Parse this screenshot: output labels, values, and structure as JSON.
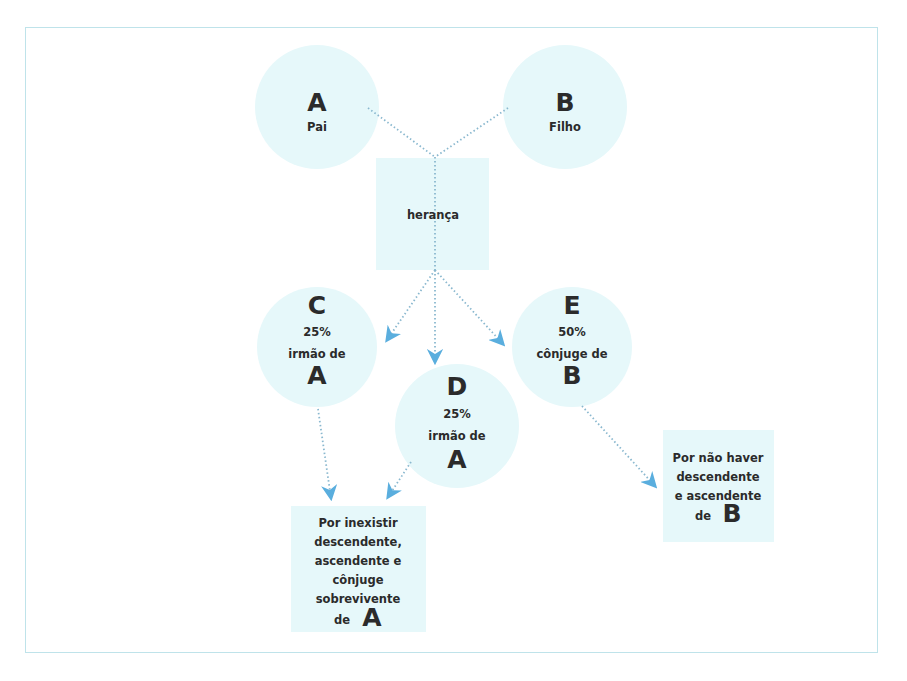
{
  "colors": {
    "fill": "#e6f8fa",
    "frame": "#bfe3ea",
    "connector": "#8ab8cf",
    "arrow": "#5aaede",
    "text": "#2b2b2b"
  },
  "nodes": {
    "A": {
      "shape": "circle",
      "letter": "A",
      "label": "Pai"
    },
    "B": {
      "shape": "circle",
      "letter": "B",
      "label": "Filho"
    },
    "heranca": {
      "shape": "square",
      "label": "herança"
    },
    "C": {
      "shape": "circle",
      "letter": "C",
      "percent": "25%",
      "relation": "irmão de",
      "ref": "A"
    },
    "D": {
      "shape": "circle",
      "letter": "D",
      "percent": "25%",
      "relation": "irmão de",
      "ref": "A"
    },
    "E": {
      "shape": "circle",
      "letter": "E",
      "percent": "50%",
      "relation": "cônjuge de",
      "ref": "B"
    },
    "note_A": {
      "shape": "box",
      "lines": [
        "Por inexistir",
        "descendente,",
        "ascendente e",
        "cônjuge",
        "sobrevivente"
      ],
      "last_prefix": "de",
      "ref": "A"
    },
    "note_B": {
      "shape": "box",
      "lines": [
        "Por não haver",
        "descendente",
        "e ascendente"
      ],
      "last_prefix": "de",
      "ref": "B"
    }
  },
  "edges": [
    {
      "from": "A",
      "to": "heranca",
      "style": "dotted",
      "arrow": false
    },
    {
      "from": "B",
      "to": "heranca",
      "style": "dotted",
      "arrow": false
    },
    {
      "from": "heranca",
      "to": "C",
      "style": "dotted",
      "arrow": true
    },
    {
      "from": "heranca",
      "to": "D",
      "style": "dotted",
      "arrow": true
    },
    {
      "from": "heranca",
      "to": "E",
      "style": "dotted",
      "arrow": true
    },
    {
      "from": "C",
      "to": "note_A",
      "style": "dotted",
      "arrow": true
    },
    {
      "from": "D",
      "to": "note_A",
      "style": "dotted",
      "arrow": true
    },
    {
      "from": "E",
      "to": "note_B",
      "style": "dotted",
      "arrow": true
    }
  ]
}
